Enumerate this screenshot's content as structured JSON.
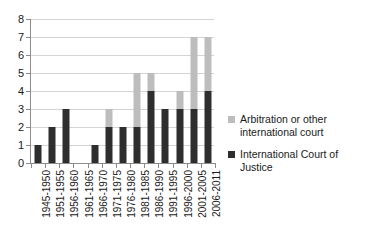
{
  "chart_data": {
    "type": "bar",
    "subtype": "stacked-column",
    "title": "",
    "subtitle": "",
    "xlabel": "",
    "ylabel": "",
    "ylim": [
      0,
      8
    ],
    "ytick_step": 1,
    "yticks": [
      "8",
      "7",
      "6",
      "5",
      "4",
      "3",
      "2",
      "1",
      "0"
    ],
    "grid": true,
    "legend_position": "right",
    "categories": [
      "1945-1950",
      "1951-1955",
      "1956-1960",
      "1961-1965",
      "1966-1970",
      "1971-1975",
      "1976-1980",
      "1981-1985",
      "1986-1990",
      "1991-1995",
      "1996-2000",
      "2001-2005",
      "2006-2011"
    ],
    "series": [
      {
        "name": "International Court of Justice",
        "color": "#2e2e2e",
        "values": [
          1,
          2,
          3,
          0,
          1,
          2,
          2,
          2,
          4,
          3,
          3,
          3,
          4
        ]
      },
      {
        "name": "Arbitration or other international court",
        "color": "#bdbdbd",
        "values": [
          0,
          0,
          0,
          0,
          0,
          1,
          0,
          3,
          1,
          0,
          1,
          4,
          3
        ]
      }
    ],
    "totals": [
      1,
      2,
      3,
      0,
      1,
      3,
      2,
      5,
      5,
      3,
      4,
      7,
      7
    ]
  },
  "legend": {
    "items": [
      {
        "label": "Arbitration or other international court",
        "color": "#bdbdbd"
      },
      {
        "label": "International Court of Justice",
        "color": "#2e2e2e"
      }
    ]
  }
}
